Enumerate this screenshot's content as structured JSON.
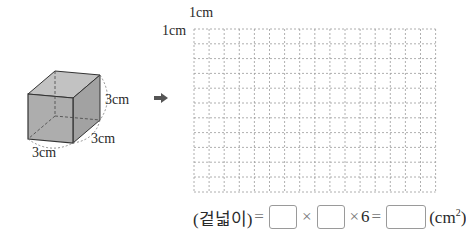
{
  "cube": {
    "edge_height": "3cm",
    "edge_depth": "3cm",
    "edge_width": "3cm",
    "face_color": "#a9a9a9",
    "side_color": "#989898",
    "top_color": "#b8b8b8"
  },
  "arrow": {
    "icon": "right-arrow-icon"
  },
  "grid": {
    "label_top": "1cm",
    "label_left": "1cm",
    "columns": 16,
    "rows": 11,
    "cell_size_label": "1cm"
  },
  "equation": {
    "lhs": "(겉넓이)",
    "equals": "=",
    "times1": "×",
    "times2": "×",
    "factor": "6",
    "equals2": "=",
    "unit_open": "(cm",
    "unit_exp": "2",
    "unit_close": ")"
  }
}
